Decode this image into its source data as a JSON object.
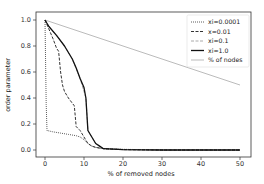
{
  "chart_data": {
    "type": "line",
    "title": "",
    "xlabel": "% of removed nodes",
    "ylabel": "order parameter",
    "xlim": [
      -4,
      53
    ],
    "ylim": [
      -0.05,
      1.05
    ],
    "xticks": [
      0,
      10,
      20,
      30,
      40,
      50
    ],
    "yticks": [
      0.0,
      0.2,
      0.4,
      0.6,
      0.8,
      1.0
    ],
    "xtick_labels": [
      "0",
      "10",
      "20",
      "30",
      "40",
      "50"
    ],
    "ytick_labels": [
      "0.0",
      "0.2",
      "0.4",
      "0.6",
      "0.8",
      "1.0"
    ],
    "grid": false,
    "legend_position": "upper right",
    "series": [
      {
        "name": "xi=0.0001",
        "style": "dotted",
        "color": "#333333",
        "x": [
          0,
          0.3,
          0.5,
          2,
          4,
          6,
          8,
          9,
          10,
          11,
          12,
          13,
          15,
          20,
          30,
          40,
          50
        ],
        "y": [
          1.0,
          0.35,
          0.15,
          0.14,
          0.13,
          0.12,
          0.11,
          0.1,
          0.08,
          0.05,
          0.03,
          0.02,
          0.01,
          0.005,
          0.0,
          0.0,
          0.0
        ]
      },
      {
        "name": "x=0.01",
        "style": "dashed",
        "color": "#333333",
        "x": [
          0,
          1,
          2,
          3,
          3.5,
          4,
          4.5,
          5,
          6,
          7,
          7.5,
          8,
          9,
          10,
          11,
          12,
          13,
          15,
          20,
          30,
          40,
          50
        ],
        "y": [
          1.0,
          0.93,
          0.86,
          0.78,
          0.76,
          0.6,
          0.5,
          0.45,
          0.4,
          0.36,
          0.34,
          0.18,
          0.15,
          0.1,
          0.05,
          0.03,
          0.02,
          0.01,
          0.003,
          0.0,
          0.0,
          0.0
        ]
      },
      {
        "name": "xi=0.1",
        "style": "dashed",
        "color": "#aaaaaa",
        "x": [
          0,
          1,
          3,
          5,
          7,
          9,
          10.5,
          11,
          12,
          13,
          15,
          20,
          30,
          40,
          50
        ],
        "y": [
          1.0,
          0.95,
          0.88,
          0.8,
          0.7,
          0.55,
          0.4,
          0.15,
          0.1,
          0.05,
          0.01,
          0.003,
          0.0,
          0.0,
          0.0
        ]
      },
      {
        "name": "xi=1.0",
        "style": "solid",
        "color": "#111111",
        "x": [
          0,
          1,
          3,
          5,
          7,
          8,
          9,
          10,
          10.5,
          11,
          12,
          13,
          14,
          15,
          20,
          30,
          40,
          50
        ],
        "y": [
          1.0,
          0.95,
          0.88,
          0.8,
          0.7,
          0.63,
          0.55,
          0.48,
          0.4,
          0.15,
          0.1,
          0.05,
          0.03,
          0.01,
          0.003,
          0.0,
          0.0,
          0.0
        ]
      },
      {
        "name": "% of nodes",
        "style": "solid",
        "color": "#aaaaaa",
        "x": [
          0,
          50
        ],
        "y": [
          1.0,
          0.5
        ]
      }
    ]
  }
}
